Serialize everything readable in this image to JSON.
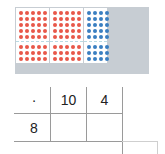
{
  "array_model": {
    "rows": 8,
    "row_split": [
      5,
      3
    ],
    "groups": [
      {
        "name": "tens-a",
        "columns": 5,
        "color": "#e8584a"
      },
      {
        "name": "tens-b",
        "columns": 5,
        "color": "#e8584a"
      },
      {
        "name": "ones",
        "columns": 4,
        "color": "#3a7fc1"
      }
    ],
    "background_color": "#c7cdd3"
  },
  "multiplication_grid": {
    "operator": "·",
    "column_headers": [
      "10",
      "4"
    ],
    "row_headers": [
      "8"
    ],
    "cells": [
      [
        "",
        ""
      ]
    ]
  }
}
